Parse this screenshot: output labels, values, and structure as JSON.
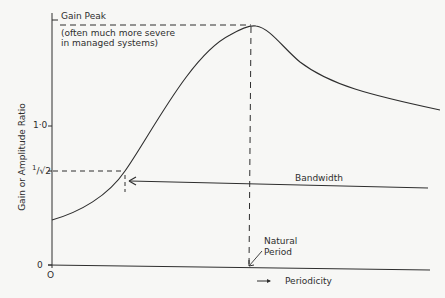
{
  "annotations": {
    "gain_peak_title": "Gain Peak",
    "gain_peak_note_line1": "(often much more severe",
    "gain_peak_note_line2": "in managed systems)",
    "bandwidth": "Bandwidth",
    "natural_period_line1": "Natural",
    "natural_period_line2": "Period",
    "periodicity": "Periodicity"
  },
  "axes": {
    "y_label": "Gain or Amplitude Ratio",
    "y_ticks": [
      "1·0",
      "1/√2",
      "0"
    ],
    "y_tick_1": "1·0",
    "y_tick_half_num": "1",
    "y_tick_half_den": "√2",
    "y_tick_0": "0",
    "x_origin": "O"
  },
  "colors": {
    "ink": "#2e2e2e",
    "background": "#f7f7f5"
  }
}
